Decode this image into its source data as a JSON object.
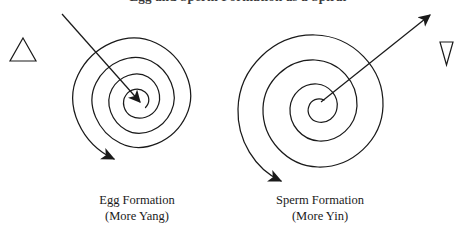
{
  "figure": {
    "title_partial": "Egg and Sperm Formation as a Spiral",
    "background_color": "#ffffff",
    "ink_color": "#1a1a1a"
  },
  "symbols": {
    "left": {
      "name": "up-triangle",
      "glyph": "△",
      "meaning": "yang"
    },
    "right": {
      "name": "down-triangle",
      "glyph": "▽",
      "meaning": "yin"
    }
  },
  "panels": [
    {
      "id": "egg",
      "caption_line1": "Egg Formation",
      "caption_line2": "(More Yang)",
      "spiral": {
        "center_x": 137,
        "center_y": 100,
        "outer_radius": 79,
        "turns": 4.6,
        "direction": "inward",
        "winding": "clockwise"
      },
      "straight_arrow": {
        "from_x": 62,
        "from_y": 14,
        "to_x": 140,
        "to_y": 103,
        "points": "inward-to-center"
      },
      "spiral_tip_arrow": {
        "points": "right",
        "at": "outer-end-top"
      }
    },
    {
      "id": "sperm",
      "caption_line1": "Sperm Formation",
      "caption_line2": "(More Yin)",
      "spiral": {
        "center_x": 320,
        "center_y": 103,
        "outer_radius": 79,
        "turns": 4.6,
        "direction": "outward",
        "winding": "counterclockwise"
      },
      "straight_arrow": {
        "from_x": 320,
        "from_y": 103,
        "to_x": 430,
        "to_y": 14,
        "points": "outward-from-center"
      },
      "spiral_tip_arrow": {
        "points": "left",
        "at": "outer-end-top"
      }
    }
  ]
}
